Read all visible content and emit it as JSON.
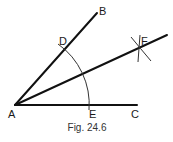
{
  "figure": {
    "caption": "Fig. 24.6",
    "points": {
      "A": "A",
      "B": "B",
      "C": "C",
      "D": "D",
      "E": "E",
      "F": "F"
    },
    "colors": {
      "line": "#111111",
      "arc": "#333333",
      "background": "#ffffff"
    }
  }
}
